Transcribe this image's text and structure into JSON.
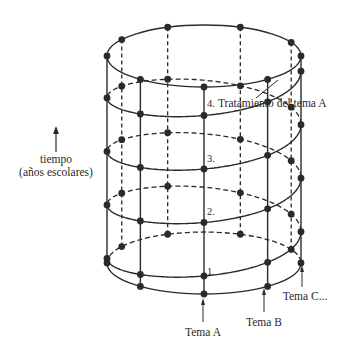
{
  "diagram": {
    "type": "spiral-curriculum",
    "time_axis": {
      "line1": "tiempo",
      "line2": "(años escolares)",
      "direction": "up"
    },
    "levels": [
      {
        "label": "1."
      },
      {
        "label": "2."
      },
      {
        "label": "3."
      },
      {
        "label": "4.",
        "annotation": "Tratamiento del tema A"
      }
    ],
    "topics": [
      {
        "label": "Tema A"
      },
      {
        "label": "Tema B"
      },
      {
        "label": "Tema C..."
      }
    ],
    "colors": {
      "ink": "#2a2a2a",
      "background": "#ffffff"
    }
  }
}
